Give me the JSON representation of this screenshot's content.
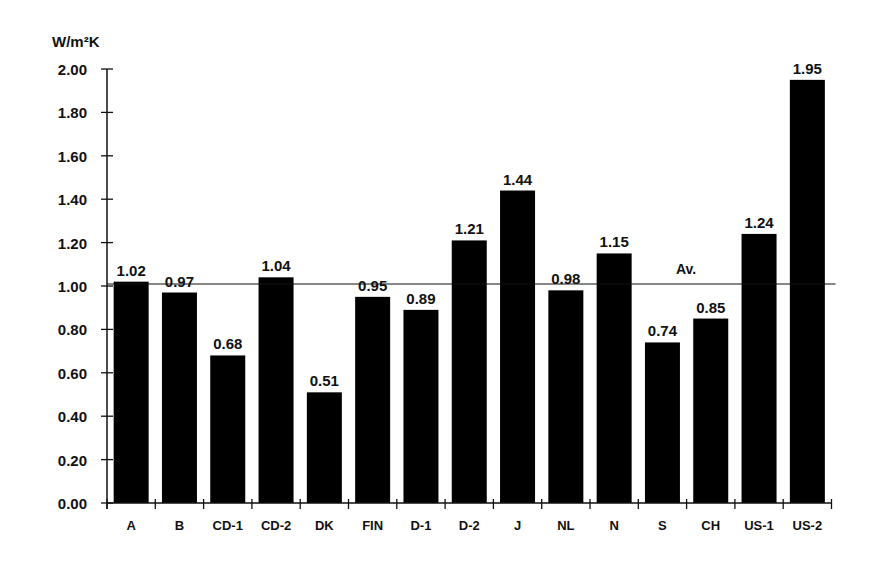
{
  "chart_data": {
    "type": "bar",
    "title": "",
    "ylabel": "W/m²K",
    "xlabel": "",
    "ylim": [
      0,
      2.0
    ],
    "yticks": [
      "0.00",
      "0.20",
      "0.40",
      "0.60",
      "0.80",
      "1.00",
      "1.20",
      "1.40",
      "1.60",
      "1.80",
      "2.00"
    ],
    "grid": false,
    "categories": [
      "A",
      "B",
      "CD-1",
      "CD-2",
      "DK",
      "FIN",
      "D-1",
      "D-2",
      "J",
      "NL",
      "N",
      "S",
      "CH",
      "US-1",
      "US-2"
    ],
    "values": [
      1.02,
      0.97,
      0.68,
      1.04,
      0.51,
      0.95,
      0.89,
      1.21,
      1.44,
      0.98,
      1.15,
      0.74,
      0.85,
      1.24,
      1.95
    ],
    "data_labels": [
      "1.02",
      "0.97",
      "0.68",
      "1.04",
      "0.51",
      "0.95",
      "0.89",
      "1.21",
      "1.44",
      "0.98",
      "1.15",
      "0.74",
      "0.85",
      "1.24",
      "1.95"
    ],
    "reference_line": {
      "label": "Av.",
      "value": 1.0
    },
    "bar_color": "#000000",
    "line_color": "#111111"
  }
}
